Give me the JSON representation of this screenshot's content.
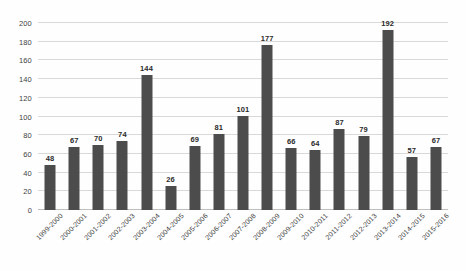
{
  "chart_data": {
    "type": "bar",
    "title": "",
    "subtitle": "",
    "xlabel": "",
    "ylabel": "",
    "ylim": [
      0,
      200
    ],
    "y_ticks": [
      0,
      20,
      40,
      60,
      80,
      100,
      120,
      140,
      160,
      180,
      200
    ],
    "grid": true,
    "legend": false,
    "legend_position": "none",
    "bar_color": "#4c4c4c",
    "gridline_color": "#d9d9d9",
    "background_color": "#fefefe",
    "data_labels": true,
    "x_tick_rotation": -45,
    "categories": [
      "1999-2000",
      "2000-2001",
      "2001-2002",
      "2002-2003",
      "2003-2004",
      "2004-2005",
      "2005-2006",
      "2006-2007",
      "2007-2008",
      "2008-2009",
      "2009-2010",
      "2010-2011",
      "2011-2012",
      "2012-2013",
      "2013-2014",
      "2014-2015",
      "2015-2016"
    ],
    "values": [
      48,
      67,
      70,
      74,
      144,
      26,
      69,
      81,
      101,
      177,
      66,
      64,
      87,
      79,
      192,
      57,
      67
    ],
    "value_labels": [
      "48",
      "67",
      "70",
      "74",
      "144",
      "26",
      "69",
      "81",
      "101",
      "177",
      "66",
      "64",
      "87",
      "79",
      "192",
      "57",
      "67"
    ],
    "y_tick_labels": [
      "0",
      "20",
      "40",
      "60",
      "80",
      "100",
      "120",
      "140",
      "160",
      "180",
      "200"
    ]
  }
}
